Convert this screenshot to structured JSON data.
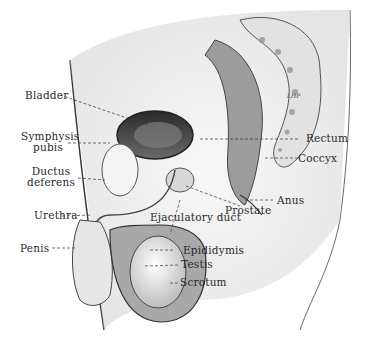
{
  "diagram": {
    "type": "anatomical-illustration",
    "labels_left": {
      "bladder": "Bladder",
      "symphysis_1": "Symphysis",
      "symphysis_2": "pubis",
      "ductus_1": "Ductus",
      "ductus_2": "deferens",
      "urethra": "Urethra",
      "penis": "Penis"
    },
    "labels_right": {
      "rectum": "Rectum",
      "coccyx": "Coccyx",
      "anus": "Anus",
      "prostate": "Prostate"
    },
    "labels_bottom": {
      "ejaculatory_duct": "Ejaculatory duct",
      "epididymis": "Epididymis",
      "testis": "Testis",
      "scrotum": "Scrotum"
    },
    "signature": "LHP"
  }
}
